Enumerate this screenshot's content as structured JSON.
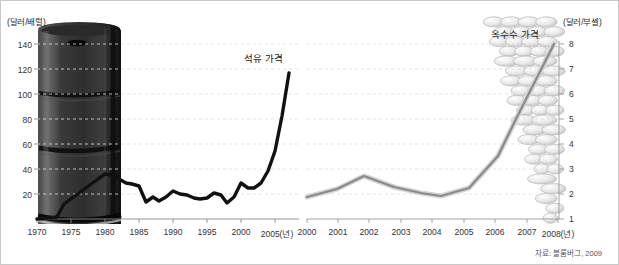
{
  "figure": {
    "source_note": "자료: 블룸버그, 2009",
    "background": "#ffffff",
    "border_color": "#c9c9c9"
  },
  "chart_data": [
    {
      "type": "line",
      "id": "oil-price",
      "title": "",
      "series_label": "석유 가격",
      "ylabel": "(달러/배럴)",
      "xlabel": "(년)",
      "grid": true,
      "legend_position": "inline-right",
      "line_color": "#111111",
      "ylim": [
        0,
        150
      ],
      "yticks": [
        20,
        40,
        60,
        80,
        100,
        120,
        140
      ],
      "ytick_labels": [
        "20",
        "40",
        "60",
        "80",
        "100",
        "120",
        "140"
      ],
      "xlim": [
        1970,
        2008
      ],
      "xticks": [
        1970,
        1975,
        1980,
        1985,
        1990,
        1995,
        2000,
        2005
      ],
      "xtick_labels": [
        "1970",
        "1975",
        "1980",
        "1985",
        "1990",
        "1995",
        "2000",
        "2005(년)"
      ],
      "x": [
        1970,
        1973,
        1974,
        1979,
        1980,
        1981,
        1982,
        1983,
        1984,
        1985,
        1986,
        1987,
        1988,
        1989,
        1990,
        1991,
        1992,
        1993,
        1994,
        1995,
        1996,
        1997,
        1998,
        1999,
        2000,
        2001,
        2002,
        2003,
        2004,
        2005,
        2006,
        2007,
        2008
      ],
      "values": [
        2,
        3,
        12,
        31,
        37,
        36,
        33,
        30,
        29,
        27,
        14,
        18,
        15,
        18,
        23,
        20,
        19,
        17,
        16,
        17,
        21,
        19,
        13,
        18,
        29,
        25,
        25,
        29,
        38,
        55,
        65,
        72,
        118
      ],
      "decoration": "oil-barrel-image"
    },
    {
      "type": "line",
      "id": "corn-price",
      "title": "",
      "series_label": "옥수수 가격",
      "ylabel": "(달러/부셸)",
      "xlabel": "(년)",
      "grid": true,
      "legend_position": "inline-top",
      "line_color": "#7a7a7a",
      "line_outline_color": "#d6d6d6",
      "ylim": [
        1,
        8
      ],
      "yticks": [
        1,
        2,
        3,
        4,
        5,
        6,
        7,
        8
      ],
      "ytick_labels": [
        "1",
        "2",
        "3",
        "4",
        "5",
        "6",
        "7",
        "8"
      ],
      "xlim": [
        2000,
        2008
      ],
      "xticks": [
        2000,
        2001,
        2002,
        2003,
        2004,
        2005,
        2006,
        2007,
        2008
      ],
      "xtick_labels": [
        "2000",
        "2001",
        "2002",
        "2003",
        "2004",
        "2005",
        "2006",
        "2007",
        "2008(년)"
      ],
      "x": [
        2000,
        2001,
        2001.9,
        2003,
        2004,
        2004.7,
        2005.6,
        2006.5,
        2007,
        2008
      ],
      "values": [
        1.95,
        2.2,
        2.8,
        2.45,
        2.25,
        2.1,
        2.45,
        3.5,
        5.0,
        8.0
      ],
      "decoration": "corn-cob-image"
    }
  ]
}
